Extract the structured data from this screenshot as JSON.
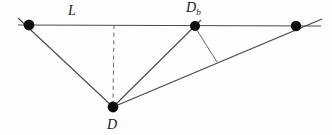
{
  "figure": {
    "background_color": "#fefefe",
    "stroke_color": "#3a3a3a",
    "node_color": "#101010",
    "labels": {
      "baseline": "L",
      "baseline_intersection": "D",
      "baseline_intersection_subscript": "b",
      "apex": "D"
    },
    "nodes": [
      {
        "name": "left-node",
        "x": 29,
        "y": 25,
        "r": 5.4,
        "label": ""
      },
      {
        "name": "baseline-node-db",
        "x": 195,
        "y": 26,
        "r": 5.0,
        "label": "D"
      },
      {
        "name": "right-node",
        "x": 296,
        "y": 26,
        "r": 5.2,
        "label": ""
      },
      {
        "name": "apex-node-d",
        "x": 113,
        "y": 107,
        "r": 5.4,
        "label": "D"
      }
    ],
    "segments": [
      {
        "name": "baseline-L",
        "x1": 18,
        "y1": 25,
        "x2": 321,
        "y2": 26,
        "style": "solid"
      },
      {
        "name": "left-leg-d-to-left-node",
        "x1": 113,
        "y1": 107,
        "x2": 18,
        "y2": 18,
        "style": "solid"
      },
      {
        "name": "mid-leg-d-to-db",
        "x1": 113,
        "y1": 107,
        "x2": 201,
        "y2": 20,
        "style": "solid"
      },
      {
        "name": "long-leg-d-to-right-node",
        "x1": 113,
        "y1": 107,
        "x2": 322,
        "y2": 19,
        "style": "solid"
      },
      {
        "name": "perpendicular-db-to-long-leg",
        "x1": 195,
        "y1": 27,
        "x2": 217,
        "y2": 62,
        "style": "solid"
      },
      {
        "name": "height-dashed-d-to-baseline",
        "x1": 114,
        "y1": 25,
        "x2": 113,
        "y2": 104,
        "style": "dashed"
      }
    ],
    "axis_ranges": {
      "x": [
        0,
        332
      ],
      "y": [
        0,
        135
      ]
    }
  }
}
